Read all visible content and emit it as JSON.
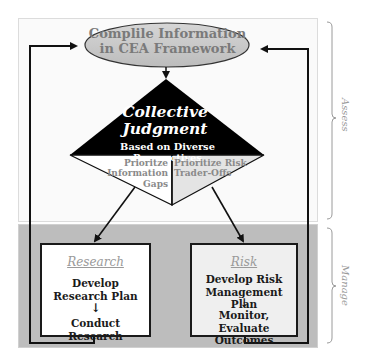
{
  "top_node": {
    "line1": "Complile Information",
    "line2": "in CEA Framework"
  },
  "decision": {
    "title_line1": "Collective",
    "title_line2": "Judgment",
    "subtitle": "Based on Diverse Perspectives",
    "left_branch": {
      "line1": "Prioritze",
      "line2": "Information",
      "line3": "Gaps"
    },
    "right_branch": {
      "line1": "Prioritize Risk",
      "line2": "Trader-Offs"
    }
  },
  "research_box": {
    "heading": "Research",
    "step1_line1": "Develop",
    "step1_line2": "Research Plan",
    "arrow": "↓",
    "step2": "Conduct Research"
  },
  "risk_box": {
    "heading": "Risk",
    "step1_line1": "Develop Risk",
    "step1_line2": "Management Plan",
    "arrow": "↓",
    "step2_line1": "Monitor, Evaluate",
    "step2_line2": "Outcomes"
  },
  "phases": {
    "assess": "Assess",
    "manage": "Manage"
  },
  "colors": {
    "assess_bg": "#fafafa",
    "manage_bg": "#bdbdbd",
    "ellipse_fill": "#c8c8c8",
    "diamond_top": "#000000",
    "diamond_right_fill": "#e4e4e4",
    "risk_box_bg": "#efefef"
  }
}
